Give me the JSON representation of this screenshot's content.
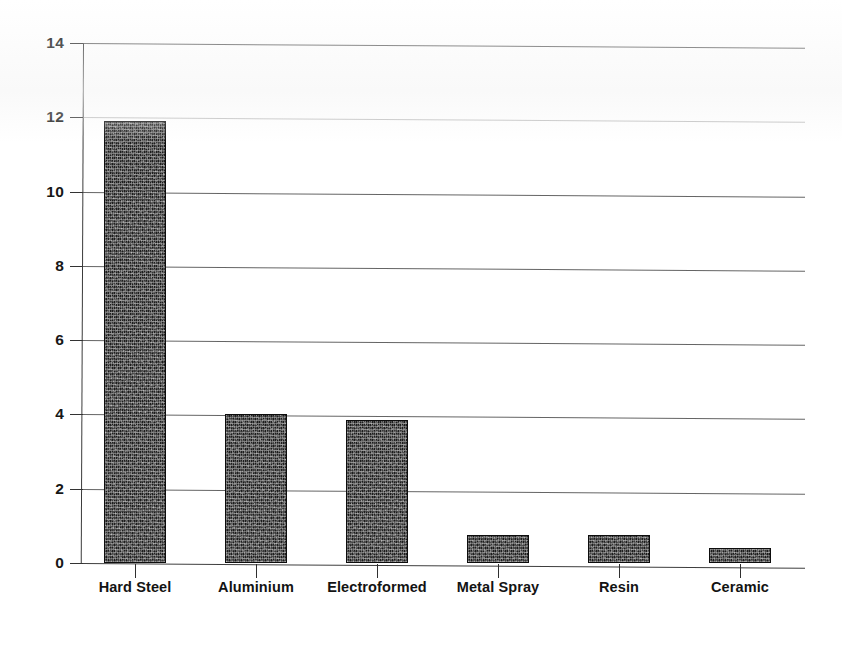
{
  "chart_data": {
    "type": "bar",
    "title": "",
    "subtitle": "",
    "xlabel": "",
    "ylabel": "",
    "categories": [
      "Hard Steel",
      "Aluminium",
      "Electroformed",
      "Metal Spray",
      "Resin",
      "Ceramic"
    ],
    "values": [
      11.9,
      4.0,
      3.85,
      0.75,
      0.75,
      0.4
    ],
    "series": [
      {
        "name": "",
        "values": [
          11.9,
          4.0,
          3.85,
          0.75,
          0.75,
          0.4
        ]
      }
    ],
    "ylim": [
      0,
      14
    ],
    "yticks": [
      0,
      2,
      4,
      6,
      8,
      10,
      12,
      14
    ],
    "ytick_labels": [
      "0",
      "2",
      "4",
      "6",
      "8",
      "10",
      "12",
      "14"
    ],
    "grid": true,
    "grid_axis": "y",
    "legend": false,
    "legend_position": "none",
    "bar_color": "#1d1d1d",
    "bar_fill_pattern": "dark-speckled-halftone",
    "background_color": "#ffffff",
    "axis_color": "#333333"
  },
  "axes": {
    "y_ticks": [
      {
        "label": "14",
        "value": 14
      },
      {
        "label": "12",
        "value": 12
      },
      {
        "label": "10",
        "value": 10
      },
      {
        "label": "8",
        "value": 8
      },
      {
        "label": "6",
        "value": 6
      },
      {
        "label": "4",
        "value": 4
      },
      {
        "label": "2",
        "value": 2
      },
      {
        "label": "0",
        "value": 0
      }
    ],
    "x_categories": [
      {
        "label": "Hard Steel"
      },
      {
        "label": "Aluminium"
      },
      {
        "label": "Electroformed"
      },
      {
        "label": "Metal Spray"
      },
      {
        "label": "Resin"
      },
      {
        "label": "Ceramic"
      }
    ]
  }
}
